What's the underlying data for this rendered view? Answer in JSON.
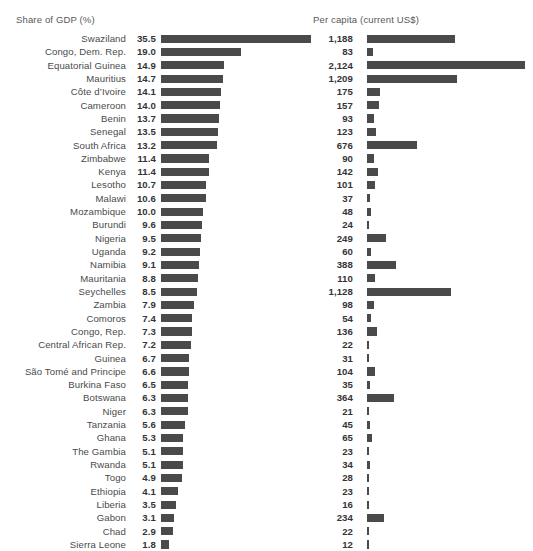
{
  "chart_data": {
    "type": "bar",
    "title": "",
    "subtitle": "",
    "orientation": "horizontal",
    "panels": [
      {
        "name": "share-of-gdp",
        "header": "Share of GDP (%)",
        "unit": "%",
        "xlabel": "",
        "ylabel": "",
        "xlim": [
          0,
          35.5
        ],
        "grid": false
      },
      {
        "name": "per-capita",
        "header": "Per capita (current US$)",
        "unit": "current US$",
        "xlabel": "",
        "ylabel": "",
        "xlim": [
          0,
          2124
        ],
        "grid": false
      }
    ],
    "legend": [],
    "sorted_by": "share-of-gdp descending",
    "categories": [
      "Swaziland",
      "Congo, Dem. Rep.",
      "Equatorial Guinea",
      "Mauritius",
      "Côte d’Ivoire",
      "Cameroon",
      "Benin",
      "Senegal",
      "South Africa",
      "Zimbabwe",
      "Kenya",
      "Lesotho",
      "Malawi",
      "Mozambique",
      "Burundi",
      "Nigeria",
      "Uganda",
      "Namibia",
      "Mauritania",
      "Seychelles",
      "Zambia",
      "Comoros",
      "Congo, Rep.",
      "Central African Rep.",
      "Guinea",
      "São Tomé and Principe",
      "Burkina Faso",
      "Botswana",
      "Niger",
      "Tanzania",
      "Ghana",
      "The Gambia",
      "Rwanda",
      "Togo",
      "Ethiopia",
      "Liberia",
      "Gabon",
      "Chad",
      "Sierra Leone"
    ],
    "series": [
      {
        "name": "Share of GDP (%)",
        "panel": "share-of-gdp",
        "values": [
          35.5,
          19.0,
          14.9,
          14.7,
          14.1,
          14.0,
          13.7,
          13.5,
          13.2,
          11.4,
          11.4,
          10.7,
          10.6,
          10.0,
          9.6,
          9.5,
          9.2,
          9.1,
          8.8,
          8.5,
          7.9,
          7.4,
          7.3,
          7.2,
          6.7,
          6.6,
          6.5,
          6.3,
          6.3,
          5.6,
          5.3,
          5.1,
          5.1,
          4.9,
          4.1,
          3.5,
          3.1,
          2.9,
          1.8
        ],
        "labels": [
          "35.5",
          "19.0",
          "14.9",
          "14.7",
          "14.1",
          "14.0",
          "13.7",
          "13.5",
          "13.2",
          "11.4",
          "11.4",
          "10.7",
          "10.6",
          "10.0",
          "9.6",
          "9.5",
          "9.2",
          "9.1",
          "8.8",
          "8.5",
          "7.9",
          "7.4",
          "7.3",
          "7.2",
          "6.7",
          "6.6",
          "6.5",
          "6.3",
          "6.3",
          "5.6",
          "5.3",
          "5.1",
          "5.1",
          "4.9",
          "4.1",
          "3.5",
          "3.1",
          "2.9",
          "1.8"
        ]
      },
      {
        "name": "Per capita (current US$)",
        "panel": "per-capita",
        "values": [
          1188,
          83,
          2124,
          1209,
          175,
          157,
          93,
          123,
          676,
          90,
          142,
          101,
          37,
          48,
          24,
          249,
          60,
          388,
          110,
          1128,
          98,
          54,
          136,
          22,
          31,
          104,
          35,
          364,
          21,
          45,
          65,
          23,
          34,
          28,
          23,
          16,
          234,
          22,
          12
        ],
        "labels": [
          "1,188",
          "83",
          "2,124",
          "1,209",
          "175",
          "157",
          "93",
          "123",
          "676",
          "90",
          "142",
          "101",
          "37",
          "48",
          "24",
          "249",
          "60",
          "388",
          "110",
          "1,128",
          "98",
          "54",
          "136",
          "22",
          "31",
          "104",
          "35",
          "364",
          "21",
          "45",
          "65",
          "23",
          "34",
          "28",
          "23",
          "16",
          "234",
          "22",
          "12"
        ]
      }
    ],
    "colors": {
      "bar": "#4a4a4a",
      "background": "#ffffff",
      "category_label": "#4a4a4c",
      "value_label": "#343436",
      "header_label": "#58585a"
    }
  }
}
